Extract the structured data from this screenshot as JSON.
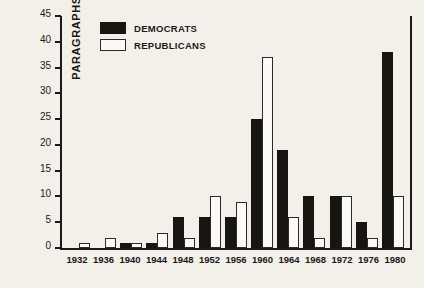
{
  "chart_data": {
    "type": "bar",
    "title": "",
    "xlabel": "",
    "ylabel": "PARAGRAPHS",
    "ylim": [
      0,
      45
    ],
    "ytick_step": 5,
    "yticks": [
      45,
      40,
      35,
      30,
      25,
      20,
      15,
      10,
      5,
      0
    ],
    "grid": false,
    "legend_position": "top-left-inside",
    "categories": [
      "1932",
      "1936",
      "1940",
      "1944",
      "1948",
      "1952",
      "1956",
      "1960",
      "1964",
      "1968",
      "1972",
      "1976",
      "1980"
    ],
    "series": [
      {
        "name": "DEMOCRATS",
        "color": "#17150f",
        "fill": "solid",
        "values": [
          0,
          0,
          1,
          1,
          6,
          6,
          6,
          25,
          19,
          10,
          10,
          5,
          38
        ]
      },
      {
        "name": "REPUBLICANS",
        "color": "#fbfaf6",
        "fill": "outline",
        "values": [
          1,
          2,
          1,
          3,
          2,
          10,
          9,
          37,
          6,
          2,
          10,
          2,
          10
        ]
      }
    ]
  },
  "legend": {
    "items": [
      {
        "label": "DEMOCRATS",
        "swatch": "filled-black-square"
      },
      {
        "label": "REPUBLICANS",
        "swatch": "open-white-square"
      }
    ]
  },
  "axes": {
    "y_title": "PARAGRAPHS",
    "y_ticks": [
      "45",
      "40",
      "35",
      "30",
      "25",
      "20",
      "15",
      "10",
      "5",
      "0"
    ],
    "x_ticks": [
      "1932",
      "1936",
      "1940",
      "1944",
      "1948",
      "1952",
      "1956",
      "1960",
      "1964",
      "1968",
      "1972",
      "1976",
      "1980"
    ]
  },
  "colors": {
    "background": "#f2f0e9",
    "axis": "#1a1a1a",
    "democrat": "#17150f",
    "republican": "#fbfaf6"
  }
}
